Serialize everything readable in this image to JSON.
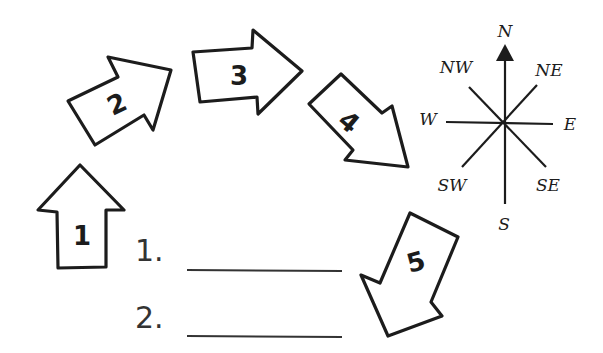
{
  "arrows": [
    {
      "number": "1",
      "direction": "N"
    },
    {
      "number": "2",
      "direction": "NE"
    },
    {
      "number": "3",
      "direction": "E"
    },
    {
      "number": "4",
      "direction": "SE"
    },
    {
      "number": "5",
      "direction": "SW"
    }
  ],
  "compass": {
    "n": "N",
    "ne": "NE",
    "e": "E",
    "se": "SE",
    "s": "S",
    "sw": "SW",
    "w": "W",
    "nw": "NW"
  },
  "questions": [
    {
      "label": "1.",
      "answer": ""
    },
    {
      "label": "2.",
      "answer": ""
    }
  ],
  "colors": {
    "ink": "#1c1c1c",
    "background": "#ffffff"
  }
}
